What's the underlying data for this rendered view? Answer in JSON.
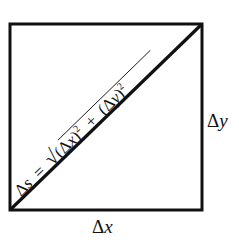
{
  "diagram": {
    "type": "right-triangle-in-square",
    "stroke_color": "#111111",
    "background": "#ffffff",
    "labels": {
      "bottom": {
        "delta": "Δ",
        "var": "x"
      },
      "right": {
        "delta": "Δ",
        "var": "y"
      },
      "diagonal": {
        "lhs_delta": "Δ",
        "lhs_var": "s",
        "equals": "=",
        "radical": "√",
        "term1_open": "(Δ",
        "term1_var": "x",
        "term1_close": ")",
        "exp1": "2",
        "plus": "+",
        "term2_open": "(Δ",
        "term2_var": "y",
        "term2_close": ")",
        "exp2": "2"
      }
    }
  }
}
